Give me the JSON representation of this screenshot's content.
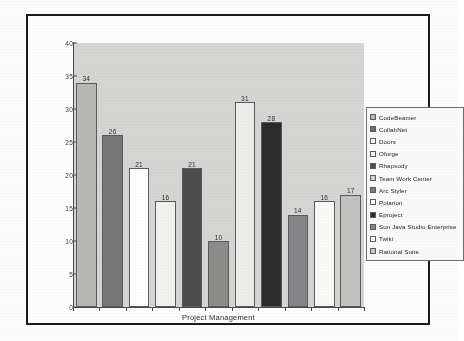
{
  "chart_data": {
    "type": "bar",
    "title": "",
    "xlabel": "Project Management",
    "ylabel": "",
    "ylim": [
      0,
      40
    ],
    "yticks": [
      0,
      5,
      10,
      15,
      20,
      25,
      30,
      35,
      40
    ],
    "grid": false,
    "legend_position": "right",
    "categories": [
      "Project Management"
    ],
    "series": [
      {
        "name": "CodeBeamer",
        "values": [
          34
        ],
        "color": "#b9b9b7"
      },
      {
        "name": "CollabNet",
        "values": [
          26
        ],
        "color": "#78787a"
      },
      {
        "name": "Doors",
        "values": [
          21
        ],
        "color": "#ffffff"
      },
      {
        "name": "Oforge",
        "values": [
          16
        ],
        "color": "#f2f2f0"
      },
      {
        "name": "Rhapsody",
        "values": [
          21
        ],
        "color": "#4d4d4f"
      },
      {
        "name": "Team Work Center",
        "values": [
          10
        ],
        "color": "#8d8d8c"
      },
      {
        "name": "Arc Styler",
        "values": [
          31
        ],
        "color": "#ededeb"
      },
      {
        "name": "Polarion",
        "values": [
          28
        ],
        "color": "#2b2b2d"
      },
      {
        "name": "Eproject",
        "values": [
          14
        ],
        "color": "#85858a"
      },
      {
        "name": "Sun Java Studio Enterprise",
        "values": [
          16
        ],
        "color": "#fafaf8"
      },
      {
        "name": "Twiki",
        "values": [
          17
        ],
        "color": "#c3c3c1"
      },
      {
        "name": "Rational Suite",
        "values": [
          0
        ],
        "color": "#d0d0ce"
      }
    ],
    "bar_values": [
      34,
      26,
      21,
      16,
      21,
      10,
      31,
      28,
      14,
      16,
      17
    ]
  },
  "legend": {
    "items": [
      {
        "label": "CodeBeamer",
        "color": "#b9b9b7"
      },
      {
        "label": "CollabNet",
        "color": "#6f6f71"
      },
      {
        "label": "Doors",
        "color": "#ffffff"
      },
      {
        "label": "Oforge",
        "color": "#f5f5f3"
      },
      {
        "label": "Rhapsody",
        "color": "#4d4d4f"
      },
      {
        "label": "Team Work Center",
        "color": "#cfcfcd"
      },
      {
        "label": "Arc Styler",
        "color": "#7c7c7e"
      },
      {
        "label": "Polarion",
        "color": "#ffffff"
      },
      {
        "label": "Eproject",
        "color": "#2b2b2d"
      },
      {
        "label": "Sun Java Studio Enterprise",
        "color": "#85858a"
      },
      {
        "label": "Twiki",
        "color": "#fbfbf9"
      },
      {
        "label": "Rational Suite",
        "color": "#c9c9c7"
      }
    ]
  },
  "axis": {
    "y_labels": [
      "40",
      "35",
      "30",
      "25",
      "20",
      "15",
      "10",
      "5",
      "0"
    ],
    "x_label": "Project Management"
  }
}
